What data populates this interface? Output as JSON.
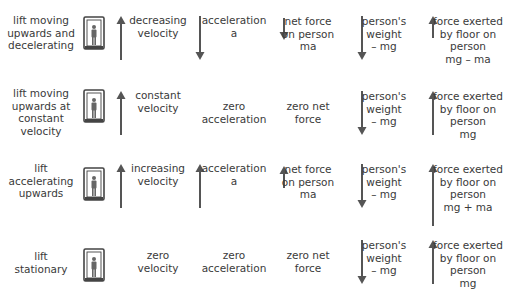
{
  "colors": {
    "text": "#3a3a3a",
    "arrow": "#555555",
    "lift_frame": "#444444"
  },
  "rows": [
    {
      "label": [
        "lift moving",
        "upwards and",
        "decelerating"
      ],
      "velocity": {
        "arrow": "up",
        "text": [
          "decreasing",
          "velocity"
        ]
      },
      "acceleration": {
        "arrow": "down",
        "text": [
          "acceleration",
          "a"
        ]
      },
      "net_force": {
        "arrow": "down-short",
        "text": [
          "net force",
          "on person",
          "ma"
        ]
      },
      "weight": {
        "arrow": "down",
        "text": [
          "person's",
          "weight",
          "– mg"
        ]
      },
      "floor_force": {
        "arrow": "up-short",
        "text": [
          "force exerted",
          "by floor on",
          "person",
          "mg – ma"
        ]
      }
    },
    {
      "label": [
        "lift moving",
        "upwards at",
        "constant",
        "velocity"
      ],
      "velocity": {
        "arrow": "up",
        "text": [
          "constant",
          "velocity"
        ]
      },
      "acceleration": {
        "arrow": "none",
        "text": [
          "zero",
          "acceleration"
        ]
      },
      "net_force": {
        "arrow": "none",
        "text": [
          "zero net",
          "force"
        ]
      },
      "weight": {
        "arrow": "down",
        "text": [
          "person's",
          "weight",
          "– mg"
        ]
      },
      "floor_force": {
        "arrow": "up",
        "text": [
          "force exerted",
          "by floor on",
          "person",
          "mg"
        ]
      }
    },
    {
      "label": [
        "lift",
        "accelerating",
        "upwards"
      ],
      "velocity": {
        "arrow": "up",
        "text": [
          "increasing",
          "velocity"
        ]
      },
      "acceleration": {
        "arrow": "up",
        "text": [
          "acceleration",
          "a"
        ]
      },
      "net_force": {
        "arrow": "up-short",
        "text": [
          "net force",
          "on person",
          "ma"
        ]
      },
      "weight": {
        "arrow": "down",
        "text": [
          "person's",
          "weight",
          "– mg"
        ]
      },
      "floor_force": {
        "arrow": "up-long",
        "text": [
          "force exerted",
          "by floor on",
          "person",
          "mg + ma"
        ]
      }
    },
    {
      "label": [
        "lift",
        "stationary"
      ],
      "velocity": {
        "arrow": "none",
        "text": [
          "zero",
          "velocity"
        ]
      },
      "acceleration": {
        "arrow": "none",
        "text": [
          "zero",
          "acceleration"
        ]
      },
      "net_force": {
        "arrow": "none",
        "text": [
          "zero net",
          "force"
        ]
      },
      "weight": {
        "arrow": "down",
        "text": [
          "person's",
          "weight",
          "– mg"
        ]
      },
      "floor_force": {
        "arrow": "up",
        "text": [
          "force exerted",
          "by floor on",
          "person",
          "mg"
        ]
      }
    }
  ]
}
